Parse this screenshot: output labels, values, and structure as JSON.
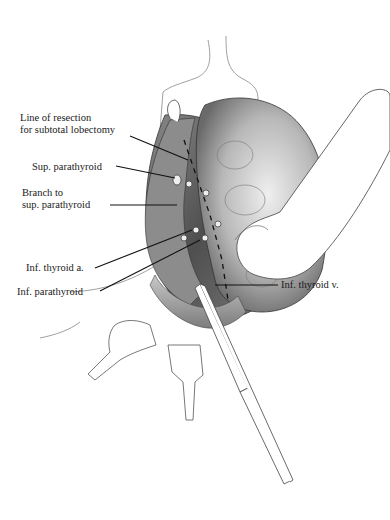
{
  "figure": {
    "labels": {
      "line_of_resection_1": "Line of resection",
      "line_of_resection_2": "for subtotal lobectomy",
      "sup_parathyroid": "Sup. parathyroid",
      "branch_1": "Branch to",
      "branch_2": "sup. parathyroid",
      "inf_thyroid_a": "Inf. thyroid a.",
      "inf_parathyroid": "Inf. parathyroid",
      "inf_thyroid_v": "Inf. thyroid v."
    },
    "colors": {
      "ink": "#1a1a1a",
      "tissue_dark": "#5a5a5a",
      "tissue_mid": "#9a9a9a",
      "tissue_light": "#d8d8d8",
      "background": "#ffffff"
    }
  }
}
